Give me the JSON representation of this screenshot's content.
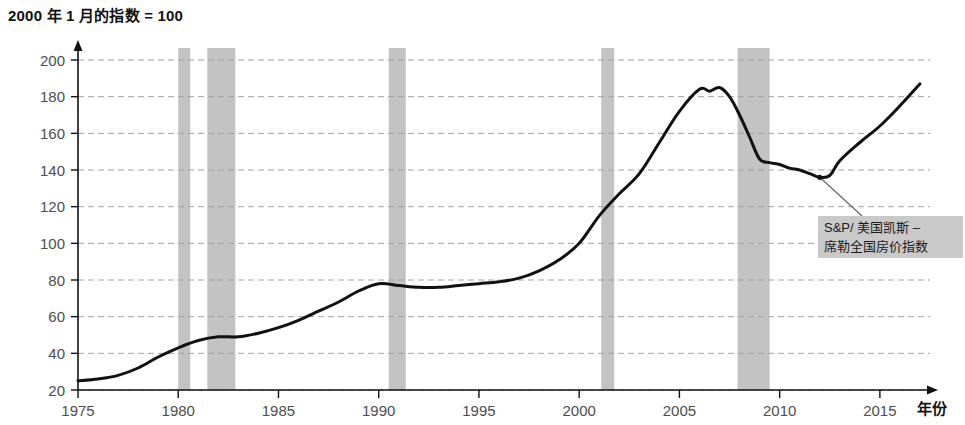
{
  "chart_data": {
    "type": "line",
    "title": "2000 年 1 月的指数 = 100",
    "xlabel": "年份",
    "ylabel": "",
    "xlim": [
      1975,
      2017.5
    ],
    "ylim": [
      20,
      200
    ],
    "grid": true,
    "legend_position": "inline-annotation",
    "series": [
      {
        "name": "S&P/ 美国凯斯 – 席勒全国房价指数",
        "color": "#111111",
        "x": [
          1975,
          1976,
          1977,
          1978,
          1979,
          1980,
          1981,
          1982,
          1983,
          1984,
          1985,
          1986,
          1987,
          1988,
          1989,
          1990,
          1991,
          1992,
          1993,
          1994,
          1995,
          1996,
          1997,
          1998,
          1999,
          2000,
          2001,
          2002,
          2003,
          2004,
          2005,
          2006,
          2006.5,
          2007,
          2007.5,
          2008,
          2008.5,
          2009,
          2009.5,
          2010,
          2010.5,
          2011,
          2011.5,
          2012,
          2012.5,
          2013,
          2014,
          2015,
          2016,
          2017
        ],
        "values": [
          25,
          26,
          28,
          32,
          38,
          43,
          47,
          49,
          49,
          51,
          54,
          58,
          63,
          68,
          74,
          78,
          77,
          76,
          76,
          77,
          78,
          79,
          81,
          85,
          91,
          100,
          115,
          127,
          138,
          155,
          172,
          184,
          183,
          185,
          180,
          170,
          158,
          146,
          144,
          143,
          141,
          140,
          138,
          136,
          137,
          145,
          155,
          164,
          175,
          187
        ]
      }
    ],
    "y_ticks": [
      20,
      40,
      60,
      80,
      100,
      120,
      140,
      160,
      180,
      200
    ],
    "x_ticks": [
      1975,
      1980,
      1985,
      1990,
      1995,
      2000,
      2005,
      2010,
      2015
    ],
    "recession_bands": [
      {
        "start": 1980.0,
        "end": 1980.6,
        "label": "1980 衰退"
      },
      {
        "start": 1981.45,
        "end": 1982.85,
        "label": "1981-82 衰退"
      },
      {
        "start": 1990.5,
        "end": 1991.35,
        "label": "1990-91 衰退"
      },
      {
        "start": 2001.1,
        "end": 2001.75,
        "label": "2001 衰退"
      },
      {
        "start": 2007.9,
        "end": 2009.5,
        "label": "2008-09 衰退"
      }
    ],
    "band_color": "#c3c3c3",
    "gridline_color": "#9aa3ad",
    "annotation": {
      "text_line1": "S&P/ 美国凯斯 –",
      "text_line2": "席勒全国房价指数",
      "background": "#c9c9c9",
      "point_x": 2012,
      "point_y": 136
    }
  }
}
